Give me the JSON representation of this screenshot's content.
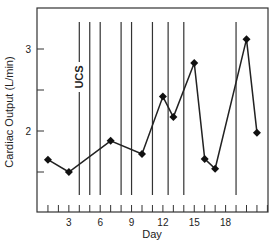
{
  "chart_data": {
    "type": "line",
    "title": "",
    "xlabel": "Day",
    "ylabel": "Cardiac Output (L/min)",
    "xlim": [
      0,
      22.1
    ],
    "ylim": [
      1.0,
      3.47
    ],
    "x_ticks": [
      3,
      6,
      9,
      12,
      15,
      18
    ],
    "x_minor_ticks": [
      1,
      2,
      3,
      4,
      5,
      6,
      7,
      8,
      9,
      10,
      11,
      12,
      13,
      14,
      15,
      16,
      17,
      18,
      19,
      20,
      21,
      22
    ],
    "y_ticks": [
      2,
      3
    ],
    "y_minor_ticks": [
      1.5,
      2.5
    ],
    "grid": false,
    "legend": null,
    "series": [
      {
        "name": "Cardiac Output",
        "marker": "diamond",
        "x": [
          1,
          3,
          7,
          10,
          12,
          13,
          15,
          16,
          17,
          20,
          21
        ],
        "values": [
          1.65,
          1.5,
          1.88,
          1.72,
          2.42,
          2.17,
          2.83,
          1.66,
          1.54,
          3.12,
          1.98
        ]
      }
    ],
    "vertical_event_lines": [
      4,
      5,
      6,
      8,
      9,
      11,
      12.5,
      14,
      19
    ],
    "annotations": [
      {
        "text": "UCS",
        "x": 4,
        "orientation": "vertical"
      }
    ]
  }
}
